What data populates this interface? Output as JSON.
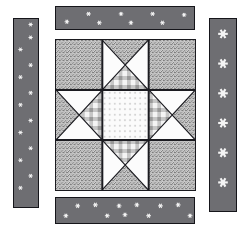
{
  "diagram": {
    "type": "quilt-block-diagram",
    "canvas": {
      "width": 250,
      "height": 232,
      "background": "#ffffff"
    }
  },
  "fabrics": {
    "speckle": {
      "name": "speckled-gray-print",
      "base_color": "#d8d8d8",
      "fleck_color": "#4a4a4a",
      "description": "salt and pepper mottled gray print"
    },
    "plaid": {
      "name": "gray-plaid-check",
      "base_color": "#f2f2f2",
      "band_color": "#b9b9b9",
      "cross_color": "#8a8a8a",
      "description": "light gingham plaid with gray bands"
    },
    "starprint": {
      "name": "white-star-print",
      "base_color": "#fbfbfb",
      "motif_color": "#c9c9c9",
      "description": "near-white ground scattered with tiny gray stars"
    },
    "solid_light": {
      "name": "solid-white",
      "base_color": "#fcfcfc",
      "description": "plain white background fabric"
    },
    "sashing": {
      "name": "dark-gray-star-print",
      "base_color": "#6e6e72",
      "motif_color": "#f4f4f4",
      "border_color": "#15151a",
      "description": "dark gray strip printed with white stars"
    }
  },
  "block": {
    "label": "center-star-block",
    "rows": 3,
    "columns": 3,
    "seam_color": "#1b1b20",
    "units": [
      {
        "position": "top-left",
        "type": "plain-square",
        "fabric": "speckle"
      },
      {
        "position": "top-center",
        "type": "quarter-square-triangle",
        "triangles": {
          "top": "speckle",
          "right": "solid_light",
          "bottom": "plaid",
          "left": "solid_light"
        }
      },
      {
        "position": "top-right",
        "type": "plain-square",
        "fabric": "speckle"
      },
      {
        "position": "middle-left",
        "type": "quarter-square-triangle",
        "triangles": {
          "top": "solid_light",
          "right": "plaid",
          "bottom": "solid_light",
          "left": "speckle"
        }
      },
      {
        "position": "center",
        "type": "plain-square",
        "fabric": "starprint"
      },
      {
        "position": "middle-right",
        "type": "quarter-square-triangle",
        "triangles": {
          "top": "solid_light",
          "right": "speckle",
          "bottom": "solid_light",
          "left": "plaid"
        }
      },
      {
        "position": "bottom-left",
        "type": "plain-square",
        "fabric": "speckle"
      },
      {
        "position": "bottom-center",
        "type": "quarter-square-triangle",
        "triangles": {
          "top": "plaid",
          "right": "solid_light",
          "bottom": "speckle",
          "left": "solid_light"
        }
      },
      {
        "position": "bottom-right",
        "type": "plain-square",
        "fabric": "speckle"
      }
    ]
  },
  "strips": [
    {
      "id": "strip-top",
      "label": "top-sashing-strip",
      "orientation": "horizontal",
      "fabric": "sashing",
      "star_count": 8,
      "star_size": "small",
      "star_rows": 2
    },
    {
      "id": "strip-bottom",
      "label": "bottom-sashing-strip",
      "orientation": "horizontal",
      "fabric": "sashing",
      "star_count": 11,
      "star_size": "small",
      "star_rows": 2
    },
    {
      "id": "strip-left",
      "label": "left-sashing-strip",
      "orientation": "vertical",
      "fabric": "sashing",
      "star_count": 13,
      "star_size": "small",
      "star_rows": 2
    },
    {
      "id": "strip-right",
      "label": "right-sashing-strip",
      "orientation": "vertical",
      "fabric": "sashing",
      "star_count": 6,
      "star_size": "large",
      "star_rows": 1
    }
  ]
}
